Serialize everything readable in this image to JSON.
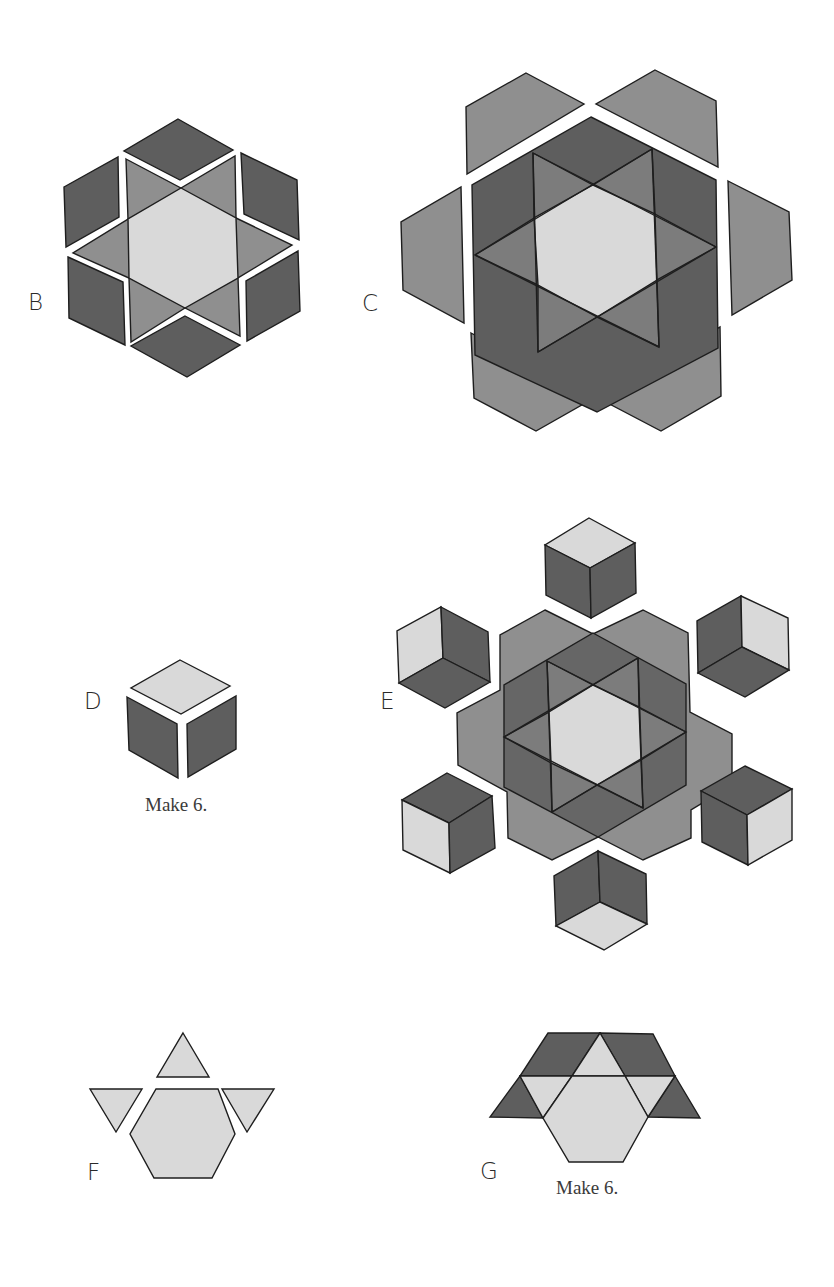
{
  "diagram": {
    "colors": {
      "light": "#d9d9d9",
      "medium": "#8f8f8f",
      "medium_dark": "#767676",
      "dark": "#5e5e5e",
      "stroke": "#1e1e1e",
      "background": "#ffffff"
    },
    "steps": [
      {
        "id": "B",
        "label": "B",
        "description": "Star of six medium triangles around a light hexagon, with six dark diamonds set in around the star"
      },
      {
        "id": "C",
        "label": "C",
        "description": "Assembled star hexagon with six medium hexagon-half pieces placed around it"
      },
      {
        "id": "D",
        "label": "D",
        "description": "Tumbling-block cube unit: one light diamond on top, two dark diamonds below",
        "caption": "Make 6."
      },
      {
        "id": "E",
        "label": "E",
        "description": "Assembled center with six cube units arranged around it"
      },
      {
        "id": "F",
        "label": "F",
        "description": "Light hexagon with three light triangles: one above, two beside"
      },
      {
        "id": "G",
        "label": "G",
        "description": "Light hexagon and triangles joined with dark parallelograms and triangles",
        "caption": "Make 6."
      }
    ]
  }
}
